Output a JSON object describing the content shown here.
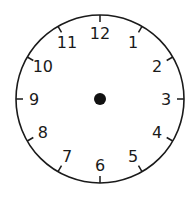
{
  "clock": {
    "numbers": [
      "12",
      "1",
      "2",
      "3",
      "4",
      "5",
      "6",
      "7",
      "8",
      "9",
      "10",
      "11"
    ],
    "center_dot": true,
    "hands": "none",
    "colors": {
      "face": "#ffffff",
      "stroke": "#1a1a1a"
    }
  }
}
